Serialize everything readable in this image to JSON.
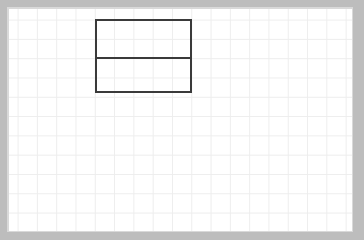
{
  "canvas": {
    "label": "grid-paper-canvas",
    "width": 343,
    "height": 222,
    "background_color": "#ffffff",
    "grid_line_color": "#ededed",
    "grid_spacing_px": 19.3,
    "frame_color": "#bdbdbd",
    "frame_width_px": 9
  },
  "drawing": {
    "label": "two-part-rectangle-diagram",
    "stroke_color": "#3a3a3a",
    "stroke_width_px": 2,
    "fill": "none",
    "shapes": [
      {
        "name": "outer-rectangle",
        "type": "rect",
        "x": 87,
        "y": 11,
        "width": 95,
        "height": 72
      },
      {
        "name": "horizontal-divider",
        "type": "line",
        "x1": 87,
        "y1": 49,
        "x2": 182,
        "y2": 49
      }
    ],
    "regions": [
      {
        "name": "upper-region",
        "x": 87,
        "y": 11,
        "width": 95,
        "height": 38
      },
      {
        "name": "lower-region",
        "x": 87,
        "y": 49,
        "width": 95,
        "height": 34
      }
    ]
  }
}
